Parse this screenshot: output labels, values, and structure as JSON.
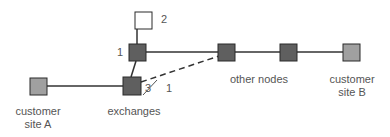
{
  "diagram": {
    "type": "network-topology",
    "colors": {
      "exchange_fill": "#5f5f5f",
      "customer_fill": "#a0a0a0",
      "spare_fill": "#ffffff",
      "stroke": "#2a2a2a",
      "link": "#333333",
      "text": "#555555"
    },
    "nodes": [
      {
        "id": "customer-site-a",
        "kind": "customer"
      },
      {
        "id": "exchange-3",
        "kind": "exchange"
      },
      {
        "id": "exchange-1",
        "kind": "exchange"
      },
      {
        "id": "spare-2",
        "kind": "spare"
      },
      {
        "id": "other-node-1",
        "kind": "exchange"
      },
      {
        "id": "other-node-2",
        "kind": "exchange"
      },
      {
        "id": "customer-site-b",
        "kind": "customer"
      }
    ],
    "links": [
      {
        "from": "customer-site-a",
        "to": "exchange-3",
        "style": "solid"
      },
      {
        "from": "exchange-3",
        "to": "exchange-1",
        "style": "solid"
      },
      {
        "from": "exchange-1",
        "to": "spare-2",
        "style": "solid"
      },
      {
        "from": "exchange-1",
        "to": "other-node-1",
        "style": "solid"
      },
      {
        "from": "exchange-3",
        "to": "other-node-1",
        "style": "dashed"
      },
      {
        "from": "other-node-1",
        "to": "other-node-2",
        "style": "solid"
      },
      {
        "from": "other-node-2",
        "to": "customer-site-b",
        "style": "solid"
      }
    ],
    "labels": {
      "customer_a_line1": "customer",
      "customer_a_line2": "site A",
      "exchanges": "exchanges",
      "other_nodes": "other nodes",
      "customer_b_line1": "customer",
      "customer_b_line2": "site B"
    },
    "numbers": {
      "exchange_upper": "1",
      "spare": "2",
      "exchange_lower": "3",
      "dashed_link": "1"
    }
  }
}
